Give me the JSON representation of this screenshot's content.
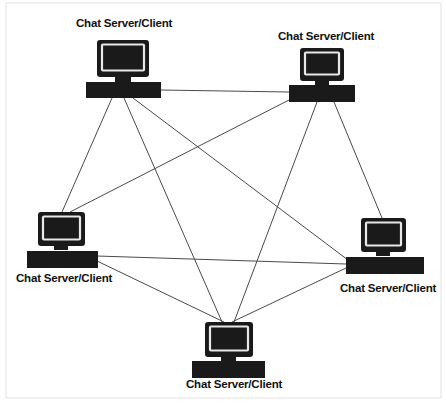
{
  "diagram": {
    "type": "network-topology",
    "topology": "full-mesh",
    "background_color": "#ffffff",
    "line_color": "#4a4a4a",
    "icon_color": "#1a1a1a",
    "screen_highlight_color": "#e8e8e8",
    "label_color": "#111111",
    "node_count": 5,
    "edge_count": 10,
    "nodes": [
      {
        "id": "node-top-left",
        "label": "Chat Server/Client",
        "icon": "desktop-computer-icon",
        "label_x": 76,
        "label_y": 27,
        "label_anchor": "start",
        "monitor": {
          "x": 97,
          "y": 40,
          "w": 52,
          "h": 37
        },
        "neck": {
          "x": 115,
          "y": 77,
          "w": 16,
          "h": 5
        },
        "keyboard": {
          "x": 86,
          "y": 82,
          "w": 75,
          "h": 16
        },
        "hub_x": 123,
        "hub_y": 98
      },
      {
        "id": "node-top-right",
        "label": "Chat Server/Client",
        "icon": "desktop-computer-icon",
        "label_x": 278,
        "label_y": 40,
        "label_anchor": "start",
        "monitor": {
          "x": 300,
          "y": 48,
          "w": 44,
          "h": 33
        },
        "neck": {
          "x": 315,
          "y": 81,
          "w": 14,
          "h": 4
        },
        "keyboard": {
          "x": 289,
          "y": 85,
          "w": 66,
          "h": 17
        },
        "hub_x": 322,
        "hub_y": 102
      },
      {
        "id": "node-left",
        "label": "Chat Server/Client",
        "icon": "desktop-computer-icon",
        "label_x": 16,
        "label_y": 282,
        "label_anchor": "start",
        "monitor": {
          "x": 38,
          "y": 212,
          "w": 47,
          "h": 34
        },
        "neck": {
          "x": 54,
          "y": 246,
          "w": 14,
          "h": 4
        },
        "keyboard": {
          "x": 27,
          "y": 251,
          "w": 71,
          "h": 17
        },
        "hub_x": 95,
        "hub_y": 256
      },
      {
        "id": "node-right",
        "label": "Chat Server/Client",
        "icon": "desktop-computer-icon",
        "label_x": 340,
        "label_y": 292,
        "label_anchor": "start",
        "monitor": {
          "x": 361,
          "y": 218,
          "w": 45,
          "h": 34
        },
        "neck": {
          "x": 376,
          "y": 252,
          "w": 14,
          "h": 4
        },
        "keyboard": {
          "x": 346,
          "y": 257,
          "w": 78,
          "h": 17
        },
        "hub_x": 349,
        "hub_y": 262
      },
      {
        "id": "node-bottom",
        "label": "Chat Server/Client",
        "icon": "desktop-computer-icon",
        "label_x": 186,
        "label_y": 388,
        "label_anchor": "start",
        "monitor": {
          "x": 205,
          "y": 322,
          "w": 48,
          "h": 35
        },
        "neck": {
          "x": 221,
          "y": 357,
          "w": 15,
          "h": 4
        },
        "keyboard": {
          "x": 192,
          "y": 361,
          "w": 73,
          "h": 17
        },
        "hub_x": 228,
        "hub_y": 322
      }
    ],
    "edges": [
      {
        "id": "edge-tl-tr",
        "from": "node-top-left",
        "to": "node-top-right",
        "x1": 161,
        "y1": 90,
        "x2": 289,
        "y2": 92
      },
      {
        "id": "edge-tl-left",
        "from": "node-top-left",
        "to": "node-left",
        "x1": 112,
        "y1": 98,
        "x2": 62,
        "y2": 212
      },
      {
        "id": "edge-tl-right",
        "from": "node-top-left",
        "to": "node-right",
        "x1": 133,
        "y1": 98,
        "x2": 348,
        "y2": 260
      },
      {
        "id": "edge-tl-bottom",
        "from": "node-top-left",
        "to": "node-bottom",
        "x1": 124,
        "y1": 98,
        "x2": 222,
        "y2": 322
      },
      {
        "id": "edge-tr-left",
        "from": "node-top-right",
        "to": "node-left",
        "x1": 289,
        "y1": 100,
        "x2": 70,
        "y2": 212
      },
      {
        "id": "edge-tr-right",
        "from": "node-top-right",
        "to": "node-right",
        "x1": 334,
        "y1": 102,
        "x2": 382,
        "y2": 218
      },
      {
        "id": "edge-tr-bottom",
        "from": "node-top-right",
        "to": "node-bottom",
        "x1": 317,
        "y1": 102,
        "x2": 234,
        "y2": 322
      },
      {
        "id": "edge-left-right",
        "from": "node-left",
        "to": "node-right",
        "x1": 97,
        "y1": 256,
        "x2": 346,
        "y2": 264
      },
      {
        "id": "edge-left-bottom",
        "from": "node-left",
        "to": "node-bottom",
        "x1": 97,
        "y1": 261,
        "x2": 224,
        "y2": 322
      },
      {
        "id": "edge-right-bottom",
        "from": "node-right",
        "to": "node-bottom",
        "x1": 346,
        "y1": 268,
        "x2": 232,
        "y2": 322
      }
    ]
  }
}
